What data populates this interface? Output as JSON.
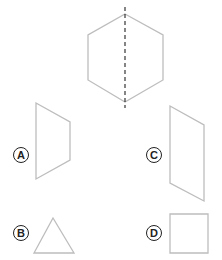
{
  "figure": {
    "stroke_color": "#bdbdbd",
    "label_color": "#222222",
    "main_shape": {
      "name": "hexagon",
      "points": "125,14 163,35 163,80 125,102 88,80 88,35",
      "fold_line": {
        "x": 125,
        "y1": 7,
        "y2": 108,
        "style": "dashed"
      }
    },
    "options": [
      {
        "label": "A",
        "shape": "trapezoid",
        "points": "36,103 70,122 70,160 36,179",
        "label_x": 13,
        "label_y": 147
      },
      {
        "label": "B",
        "shape": "triangle",
        "points": "53,218 74,253 34,253",
        "label_x": 13,
        "label_y": 225
      },
      {
        "label": "C",
        "shape": "parallelogram",
        "points": "170,106 204,125 204,201 170,183",
        "label_x": 146,
        "label_y": 147
      },
      {
        "label": "D",
        "shape": "square",
        "points": "170,214 208,214 208,253 170,253",
        "label_x": 146,
        "label_y": 225
      }
    ]
  }
}
